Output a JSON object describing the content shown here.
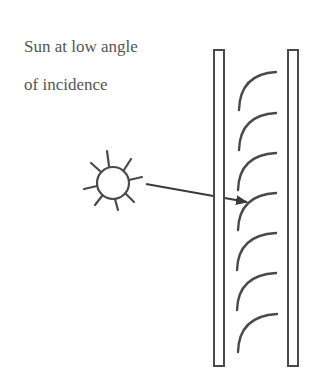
{
  "caption": {
    "line1": "Sun at low angle",
    "line2": "of incidence"
  },
  "elements": {
    "sun": "sun-icon",
    "arrow": "incident-light-arrow",
    "panes": [
      "left-glass-pane",
      "right-glass-pane"
    ],
    "louvers_count": 7
  },
  "colors": {
    "stroke": "#4a4a4a",
    "text": "#555555",
    "background": "#ffffff"
  }
}
